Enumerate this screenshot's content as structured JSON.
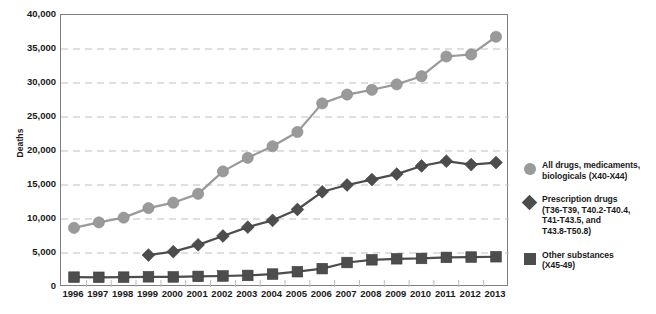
{
  "chart_data": {
    "type": "line",
    "title": "",
    "xlabel": "",
    "ylabel": "Deaths",
    "ylim": [
      0,
      40000
    ],
    "ytick_step": 5000,
    "grid": true,
    "grid_style": "dashed-horizontal",
    "legend_position": "right",
    "categories": [
      "1996",
      "1997",
      "1998",
      "1999",
      "2000",
      "2001",
      "2002",
      "2003",
      "2004",
      "2005",
      "2006",
      "2007",
      "2008",
      "2009",
      "2010",
      "2011",
      "2012",
      "2013"
    ],
    "ytick_labels": [
      "0",
      "5,000",
      "10,000",
      "15,000",
      "20,000",
      "25,000",
      "30,000",
      "35,000",
      "40,000"
    ],
    "ytick_values": [
      0,
      5000,
      10000,
      15000,
      20000,
      25000,
      30000,
      35000,
      40000
    ],
    "series": [
      {
        "name": "All drugs, medicaments, biologicals (X40-X44)",
        "marker": "circle",
        "color": "#9a9a9a",
        "line_color": "#9a9a9a",
        "values": [
          8700,
          9500,
          10200,
          11600,
          12400,
          13700,
          17000,
          19000,
          20700,
          22800,
          27000,
          28300,
          29000,
          29800,
          31000,
          33900,
          34200,
          36800
        ]
      },
      {
        "name": "Prescription drugs (T36-T39, T40.2-T40.4, T41-T43.5, and T43.8-T50.8)",
        "marker": "diamond",
        "color": "#4d4d4d",
        "line_color": "#4d4d4d",
        "values": [
          null,
          null,
          null,
          4700,
          5200,
          6200,
          7500,
          8800,
          9800,
          11400,
          14000,
          15000,
          15800,
          16600,
          17800,
          18500,
          18000,
          18300
        ]
      },
      {
        "name": "Other substances (X45-49)",
        "marker": "square",
        "color": "#4d4d4d",
        "line_color": "#4d4d4d",
        "values": [
          1450,
          1430,
          1450,
          1500,
          1480,
          1560,
          1620,
          1700,
          1900,
          2250,
          2700,
          3600,
          4000,
          4150,
          4200,
          4350,
          4400,
          4450
        ]
      }
    ]
  },
  "axes": {
    "y_title": "Deaths"
  },
  "legend": {
    "items": [
      {
        "marker": "circle",
        "color": "#9a9a9a",
        "label": "All drugs, medicaments,\nbiologicals (X40-X44)"
      },
      {
        "marker": "diamond",
        "color": "#4d4d4d",
        "label": "Prescription drugs\n(T36-T39, T40.2-T40.4,\nT41-T43.5, and\nT43.8-T50.8)"
      },
      {
        "marker": "square",
        "color": "#4d4d4d",
        "label": "Other substances\n(X45-49)"
      }
    ]
  },
  "caption": {
    "text": ""
  },
  "colors": {
    "series_light_gray": "#9a9a9a",
    "series_dark_gray": "#4d4d4d",
    "axis": "#808080",
    "grid": "#bfbfbf",
    "text": "#1a1a1a"
  }
}
